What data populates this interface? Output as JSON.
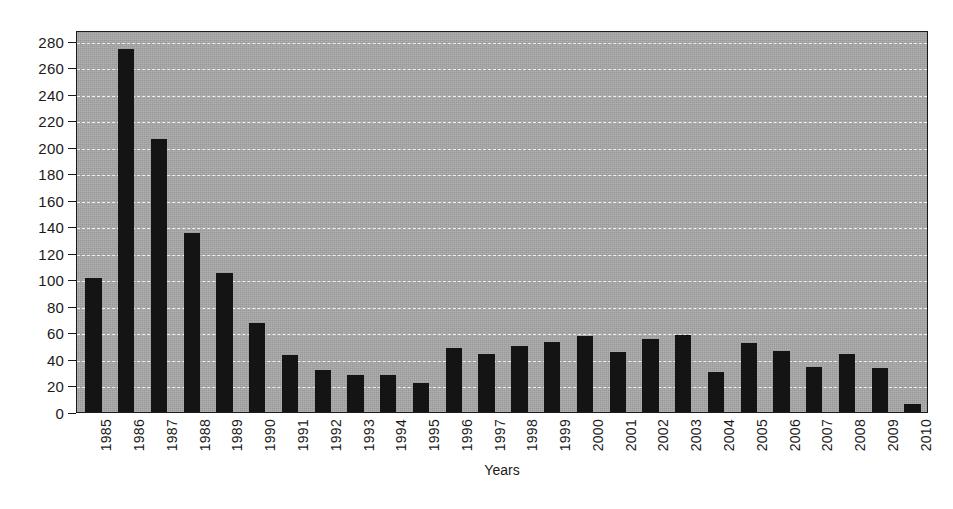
{
  "chart_data": {
    "type": "bar",
    "title": "",
    "subtitle": "",
    "xlabel": "Years",
    "ylabel": "",
    "categories": [
      "1985",
      "1986",
      "1987",
      "1988",
      "1989",
      "1990",
      "1991",
      "1992",
      "1993",
      "1994",
      "1995",
      "1996",
      "1997",
      "1998",
      "1999",
      "2000",
      "2001",
      "2002",
      "2003",
      "2004",
      "2005",
      "2006",
      "2007",
      "2008",
      "2009",
      "2010"
    ],
    "values": [
      101,
      274,
      206,
      135,
      105,
      67,
      43,
      32,
      28,
      28,
      22,
      48,
      44,
      50,
      53,
      57,
      45,
      55,
      58,
      30,
      52,
      46,
      34,
      44,
      33,
      6
    ],
    "series": [
      {
        "name": "Count",
        "values": [
          101,
          274,
          206,
          135,
          105,
          67,
          43,
          32,
          28,
          28,
          22,
          48,
          44,
          50,
          53,
          57,
          45,
          55,
          58,
          30,
          52,
          46,
          34,
          44,
          33,
          6
        ]
      }
    ],
    "ylim": [
      0,
      288
    ],
    "y_ticks": [
      0,
      20,
      40,
      60,
      80,
      100,
      120,
      140,
      160,
      180,
      200,
      220,
      240,
      260,
      280
    ],
    "y_tick_labels": [
      "0",
      "20",
      "40",
      "60",
      "80",
      "100",
      "120",
      "140",
      "160",
      "180",
      "200",
      "220",
      "240",
      "260",
      "280"
    ],
    "grid": true,
    "grid_style": "dashed",
    "legend": null,
    "legend_position": "none",
    "annotations": [],
    "colors": {
      "bar": "#141414",
      "plot_background": "#a8a8a8",
      "gridline": "#f2f2f2",
      "axis": "#1a1a1a",
      "page_background": "#ffffff",
      "text": "#1a1a1a"
    }
  }
}
